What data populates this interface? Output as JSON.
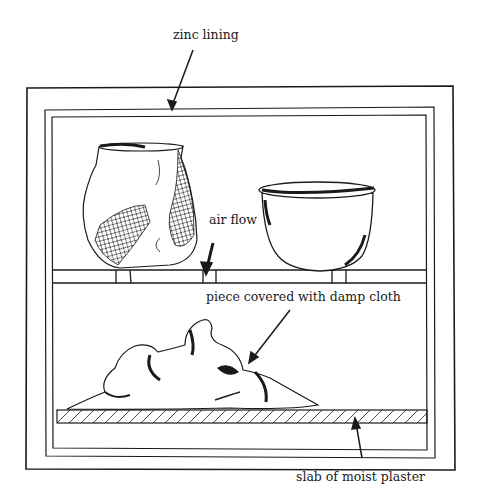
{
  "diagram": {
    "labels": {
      "zinc_lining": "zinc lining",
      "air_flow": "air flow",
      "piece_covered": "piece covered with damp cloth",
      "plaster_slab": "slab of moist plaster"
    },
    "components": [
      {
        "name": "outer box",
        "icon": "box-outline"
      },
      {
        "name": "zinc lining",
        "icon": "inner-lining"
      },
      {
        "name": "slatted shelf",
        "icon": "shelf"
      },
      {
        "name": "broken jar",
        "icon": "jar-with-mesh"
      },
      {
        "name": "bowl",
        "icon": "bowl"
      },
      {
        "name": "piece under damp cloth",
        "icon": "draped-cloth"
      },
      {
        "name": "moist plaster slab",
        "icon": "hatched-slab"
      }
    ],
    "colors": {
      "ink": "#1a1a1a",
      "paper": "#ffffff"
    }
  }
}
